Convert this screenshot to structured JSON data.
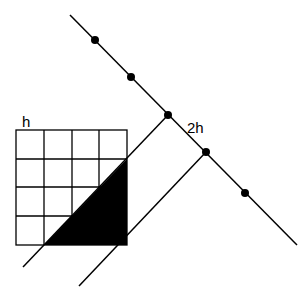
{
  "diagram": {
    "labels": {
      "grid_cell_size": "h",
      "spacing": "2h"
    },
    "colors": {
      "stroke": "#000000",
      "fill": "#000000",
      "background": "#ffffff"
    },
    "grid": {
      "rows": 4,
      "cols": 4,
      "x": [
        16,
        44,
        72,
        99,
        127
      ],
      "y": [
        130,
        159,
        187,
        216,
        245
      ]
    },
    "main_line": {
      "x1": 70,
      "y1": 15,
      "x2": 297,
      "y2": 245
    },
    "points": [
      {
        "x": 95,
        "y": 40
      },
      {
        "x": 131,
        "y": 77
      },
      {
        "x": 168,
        "y": 115
      },
      {
        "x": 206,
        "y": 152
      },
      {
        "x": 245,
        "y": 193
      }
    ],
    "perpendicular_lines": [
      {
        "x1": 168,
        "y1": 115,
        "x2": 23,
        "y2": 267
      },
      {
        "x1": 206,
        "y1": 152,
        "x2": 79,
        "y2": 286
      }
    ],
    "shaded_triangle": "44,245 127,245 127,159"
  }
}
